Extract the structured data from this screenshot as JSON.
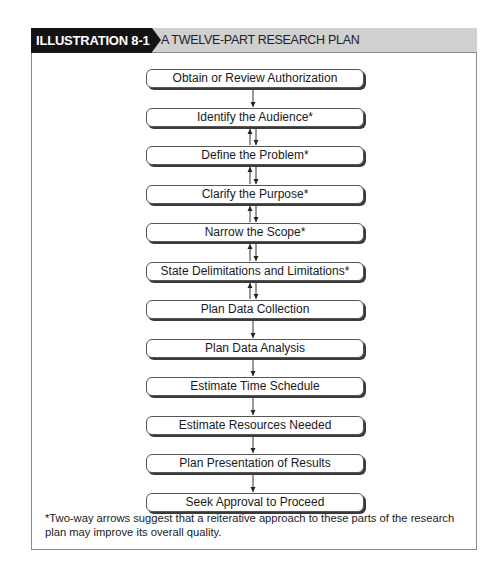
{
  "header": {
    "label": "ILLUSTRATION 8-1",
    "title": "A TWELVE-PART RESEARCH PLAN"
  },
  "steps": [
    {
      "label": "Obtain or Review Authorization",
      "arrow_below": "down"
    },
    {
      "label": "Identify the Audience*",
      "arrow_below": "two-way"
    },
    {
      "label": "Define the Problem*",
      "arrow_below": "two-way"
    },
    {
      "label": "Clarify the Purpose*",
      "arrow_below": "two-way"
    },
    {
      "label": "Narrow the Scope*",
      "arrow_below": "two-way"
    },
    {
      "label": "State Delimitations and Limitations*",
      "arrow_below": "two-way"
    },
    {
      "label": "Plan Data Collection",
      "arrow_below": "down"
    },
    {
      "label": "Plan Data Analysis",
      "arrow_below": "down"
    },
    {
      "label": "Estimate Time Schedule",
      "arrow_below": "down"
    },
    {
      "label": "Estimate Resources Needed",
      "arrow_below": "down"
    },
    {
      "label": "Plan Presentation of Results",
      "arrow_below": "down"
    },
    {
      "label": "Seek Approval to Proceed",
      "arrow_below": "none"
    }
  ],
  "footnote": "*Two-way arrows suggest that a reiterative approach to these parts of the research plan may improve its overall quality."
}
